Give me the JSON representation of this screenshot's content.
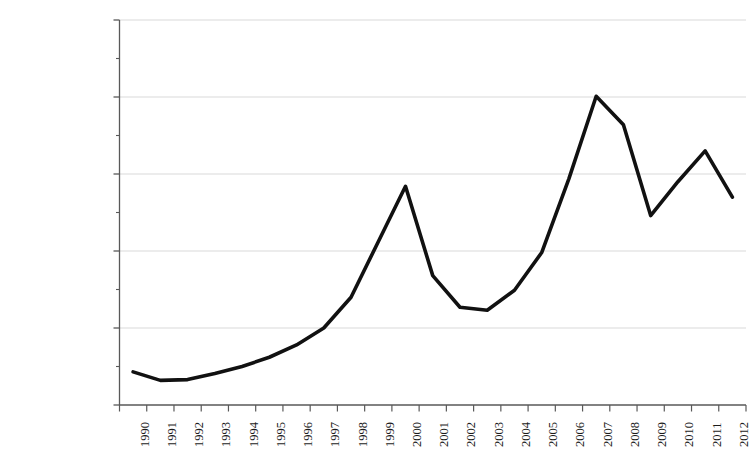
{
  "chart_data": {
    "type": "line",
    "title": "",
    "subtitle": "",
    "xlabel": "",
    "ylabel": "",
    "categories": [
      "1990",
      "1991",
      "1992",
      "1993",
      "1994",
      "1995",
      "1996",
      "1997",
      "1998",
      "1999",
      "2000",
      "2001",
      "2002",
      "2003",
      "2004",
      "2005",
      "2006",
      "2007",
      "2008",
      "2009",
      "2010",
      "2011",
      "2012"
    ],
    "values": [
      215000,
      160000,
      165000,
      205000,
      250000,
      310000,
      390000,
      500000,
      700000,
      1060000,
      1420000,
      840000,
      635000,
      615000,
      745000,
      990000,
      1470000,
      2005000,
      1820000,
      1230000,
      1450000,
      1650000,
      1350000
    ],
    "series": [
      {
        "name": "",
        "values": [
          215000,
          160000,
          165000,
          205000,
          250000,
          310000,
          390000,
          500000,
          700000,
          1060000,
          1420000,
          840000,
          635000,
          615000,
          745000,
          990000,
          1470000,
          2005000,
          1820000,
          1230000,
          1450000,
          1650000,
          1350000
        ]
      }
    ],
    "ylim": [
      0,
      2500000
    ],
    "ytick_values": [
      0,
      500000,
      1000000,
      1500000,
      2000000,
      2500000
    ],
    "ytick_labels": [
      "$-",
      "$5,00,000.00",
      "$10,00,000.00",
      "$15,00,000.00",
      "$20,00,000.00",
      "$25,00,000.00"
    ],
    "xtick_labels": [
      "1990",
      "1991",
      "1992",
      "1993",
      "1994",
      "1995",
      "1996",
      "1997",
      "1998",
      "1999",
      "2000",
      "2001",
      "2002",
      "2003",
      "2004",
      "2005",
      "2006",
      "2007",
      "2008",
      "2009",
      "2010",
      "2011",
      "2012"
    ],
    "grid": true,
    "grid_axis": "y",
    "legend": false,
    "legend_position": "none",
    "line_color": "#111111",
    "grid_color": "#d9d9d9",
    "axis_color": "#595959",
    "background_color": "#ffffff",
    "line_width": 3.6,
    "markers": false,
    "annotations": []
  }
}
